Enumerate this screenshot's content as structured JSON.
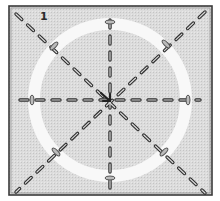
{
  "diagram": {
    "step_number": "1",
    "type": "crease-pattern",
    "square": {
      "x": 9,
      "y": 6,
      "size": 203,
      "fill": "#d9d9d9",
      "stroke": "#3a3a3a"
    },
    "ring": {
      "cx": 110,
      "cy": 100,
      "r": 78,
      "width": 12,
      "color": "#f7f7f7"
    },
    "center": {
      "x": 110,
      "y": 100
    },
    "dash_color": "#333333",
    "lines": [
      {
        "name": "diagonal-tl-br",
        "x1": 16,
        "y1": 14,
        "x2": 205,
        "y2": 193
      },
      {
        "name": "diagonal-tr-bl",
        "x1": 205,
        "y1": 12,
        "x2": 16,
        "y2": 192
      },
      {
        "name": "horizontal-center",
        "x1": 18,
        "y1": 100,
        "x2": 200,
        "y2": 100
      },
      {
        "name": "vertical-center",
        "x1": 110,
        "y1": 12,
        "x2": 110,
        "y2": 192
      }
    ]
  }
}
